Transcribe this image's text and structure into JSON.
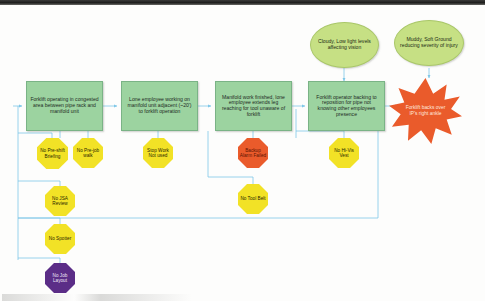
{
  "diagram": {
    "colors": {
      "event_fill": "#9cd3a0",
      "condition_fill": "#c6e084",
      "causal_factor_fill": "#f2e226",
      "critical_factor_fill": "#ea5b2b",
      "systemic_factor_fill": "#5b2d87",
      "outcome_fill": "#ea5b2b",
      "connector_line": "#7ec7e8"
    },
    "events": [
      {
        "id": "event-1",
        "label": "Forklift operating in congested area between pipe rack and manifold unit"
      },
      {
        "id": "event-2",
        "label": "Lone employee working on manifold unit adjacent (~20') to forklift operation"
      },
      {
        "id": "event-3",
        "label": "Manifold work finished, lone employee extends leg reaching for tool unaware of forklift"
      },
      {
        "id": "event-4",
        "label": "Forklift operator backing to reposition for pipe not knowing other employees presence"
      }
    ],
    "conditions": [
      {
        "id": "condition-1",
        "label": "Cloudy, Low light levels affecting vision"
      },
      {
        "id": "condition-2",
        "label": "Muddy, Soft Ground reducing severity of injury"
      }
    ],
    "outcome": {
      "id": "outcome-star",
      "label": "Forklift backs over IP's right ankle"
    },
    "causal_factors": [
      {
        "id": "factor-no-pre-shift-briefing",
        "label": "No Pre-shift Briefing",
        "kind": "yellow"
      },
      {
        "id": "factor-no-pre-job-walk",
        "label": "No Pre-job walk",
        "kind": "yellow"
      },
      {
        "id": "factor-stop-work-not-used",
        "label": "Stop Work Not used",
        "kind": "yellow"
      },
      {
        "id": "factor-backup-alarm-failed",
        "label": "Backup Alarm Failed",
        "kind": "red"
      },
      {
        "id": "factor-no-hi-vis-vest",
        "label": "No Hi-Vis Vest",
        "kind": "yellow"
      },
      {
        "id": "factor-no-tool-belt",
        "label": "No Tool Belt",
        "kind": "yellow"
      },
      {
        "id": "factor-no-jsa-review",
        "label": "No JSA Review",
        "kind": "yellow"
      },
      {
        "id": "factor-no-spotter",
        "label": "No Spotter",
        "kind": "yellow"
      },
      {
        "id": "factor-no-job-layout",
        "label": "No Job Layout",
        "kind": "purple"
      }
    ]
  }
}
